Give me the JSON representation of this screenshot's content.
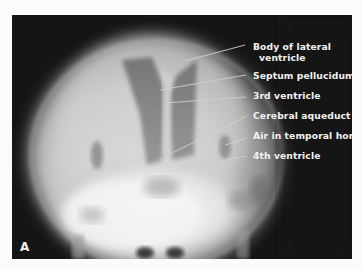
{
  "figure": {
    "panel_letter": "A",
    "labels": [
      {
        "id": "body-lateral-ventricle",
        "line1": "Body of lateral",
        "line2": "ventricle"
      },
      {
        "id": "septum-pellucidum",
        "text": "Septum pellucidum"
      },
      {
        "id": "third-ventricle",
        "text": "3rd ventricle"
      },
      {
        "id": "cerebral-aqueduct",
        "text": "Cerebral aqueduct"
      },
      {
        "id": "air-temporal-horn",
        "text": "Air in temporal horn"
      },
      {
        "id": "fourth-ventricle",
        "text": "4th ventricle"
      }
    ],
    "colors": {
      "background": "#151515",
      "label_text": "#f2f2f2",
      "leader_line": "#cfcfcf",
      "page": "#fbfbfb"
    }
  }
}
